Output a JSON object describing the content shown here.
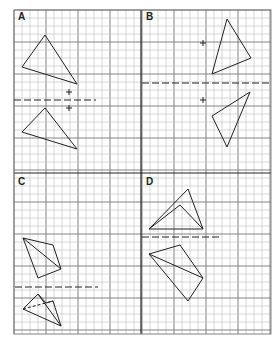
{
  "grid": {
    "x0": 14,
    "y0": 10,
    "x1": 271,
    "y1": 334,
    "cell": 8,
    "major_every": 4,
    "divider_x": 141,
    "divider_y": 173,
    "minor_color": "#bdbdbd",
    "major_color": "#777777",
    "divider_color": "#222222"
  },
  "panels": [
    {
      "label": "A",
      "label_pos": [
        18,
        11
      ],
      "mirror_line": {
        "y": 100,
        "x_from": 14,
        "x_to": 96
      },
      "marks": [
        [
          69,
          92
        ],
        [
          69,
          108
        ]
      ],
      "polygons": [
        {
          "points": [
            [
              45,
              35
            ],
            [
              22,
              67
            ],
            [
              77,
              84
            ]
          ],
          "dashed": false
        },
        {
          "points": [
            [
              45,
              108
            ],
            [
              22,
              132
            ],
            [
              77,
              149
            ]
          ],
          "dashed": false
        }
      ],
      "segments": []
    },
    {
      "label": "B",
      "label_pos": [
        146,
        11
      ],
      "mirror_line": {
        "y": 83,
        "x_from": 142,
        "x_to": 270
      },
      "marks": [
        [
          203,
          43
        ],
        [
          203,
          100
        ]
      ],
      "polygons": [
        {
          "points": [
            [
              227,
              19
            ],
            [
              251,
              58
            ],
            [
              212,
              74
            ]
          ],
          "dashed": false
        },
        {
          "points": [
            [
              250,
              92
            ],
            [
              212,
              116
            ],
            [
              227,
              147
            ]
          ],
          "dashed": false
        }
      ],
      "segments": []
    },
    {
      "label": "C",
      "label_pos": [
        18,
        176
      ],
      "mirror_line": {
        "y": 287,
        "x_from": 15,
        "x_to": 98
      },
      "marks": [],
      "polygons": [
        {
          "points": [
            [
              23,
              238
            ],
            [
              53,
              245
            ],
            [
              61,
              269
            ],
            [
              38,
              278
            ]
          ],
          "dashed": false
        },
        {
          "points": [
            [
              23,
              309
            ],
            [
              38,
              294
            ],
            [
              46,
              303
            ],
            [
              53,
              301
            ],
            [
              61,
              326
            ]
          ],
          "dashed": false
        }
      ],
      "segments": [
        {
          "from": [
            23,
            238
          ],
          "to": [
            61,
            269
          ],
          "dashed": false
        },
        {
          "from": [
            38,
            294
          ],
          "to": [
            61,
            326
          ],
          "dashed": false
        },
        {
          "from": [
            23,
            309
          ],
          "to": [
            53,
            301
          ],
          "dashed": true
        }
      ]
    },
    {
      "label": "D",
      "label_pos": [
        146,
        176
      ],
      "mirror_line": {
        "y": 237,
        "x_from": 142,
        "x_to": 221
      },
      "marks": [],
      "polygons": [
        {
          "points": [
            [
              149,
              229
            ],
            [
              188,
              189
            ],
            [
              203,
              229
            ]
          ],
          "dashed": false
        },
        {
          "points": [
            [
              149,
              254
            ],
            [
              180,
              245
            ],
            [
              203,
              278
            ],
            [
              188,
              301
            ]
          ],
          "dashed": false
        }
      ],
      "segments": [
        {
          "from": [
            149,
            229
          ],
          "to": [
            180,
            205
          ],
          "dashed": false
        },
        {
          "from": [
            180,
            205
          ],
          "to": [
            203,
            229
          ],
          "dashed": false
        },
        {
          "from": [
            149,
            254
          ],
          "to": [
            203,
            278
          ],
          "dashed": false
        }
      ]
    }
  ]
}
